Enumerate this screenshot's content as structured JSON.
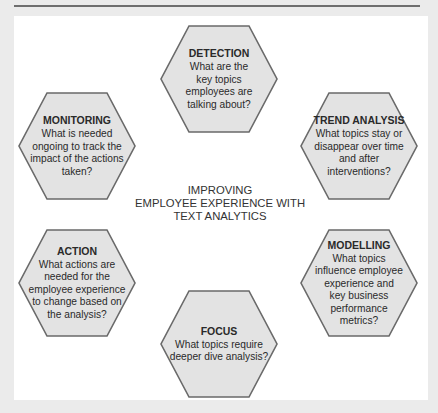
{
  "diagram": {
    "center_title": "IMPROVING\nEMPLOYEE EXPERIENCE WITH\nTEXT ANALYTICS",
    "stages": [
      {
        "id": "detection",
        "title": "DETECTION",
        "description": "What are the\nkey topics\nemployees are\ntalking about?"
      },
      {
        "id": "trend-analysis",
        "title": "TREND ANALYSIS",
        "description": "What topics stay or\ndisappear over time\nand after\ninterventions?"
      },
      {
        "id": "modelling",
        "title": "MODELLING",
        "description": "What topics\ninfluence employee\nexperience and\nkey business\nperformance\nmetrics?"
      },
      {
        "id": "focus",
        "title": "FOCUS",
        "description": "What topics require\ndeeper dive analysis?"
      },
      {
        "id": "action",
        "title": "ACTION",
        "description": "What actions are\nneeded for the\nemployee experience\nto change based on\nthe analysis?"
      },
      {
        "id": "monitoring",
        "title": "MONITORING",
        "description": "What is needed\nongoing to track the\nimpact of the actions\ntaken?"
      }
    ]
  },
  "colors": {
    "frame": "#ebebeb",
    "panel": "#ffffff",
    "hex_fill": "#e3e3e3",
    "hex_border": "#6a6a6a",
    "rule": "#6e6e6e",
    "text": "#2a2a2a"
  }
}
